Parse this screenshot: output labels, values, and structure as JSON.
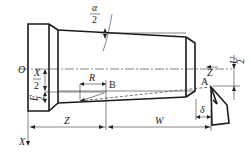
{
  "diagram": {
    "type": "taper turning geometry",
    "labels": {
      "alpha_half_num": "α",
      "alpha_half_den": "2",
      "origin": "O",
      "x_half_num": "X",
      "x_half_den": "2",
      "e_half_num": "E",
      "e_half_den": "2",
      "r": "R",
      "point_b": "B",
      "point_a": "A",
      "z_axis": "Z",
      "u_half_num": "U",
      "u_half_den": "2",
      "delta": "δ",
      "z_dim": "Z",
      "w_dim": "W",
      "x_axis": "X"
    },
    "colors": {
      "line": "#222222",
      "background": "#ffffff"
    }
  }
}
